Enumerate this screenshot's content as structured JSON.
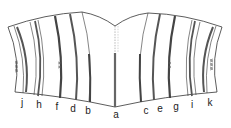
{
  "diagram": {
    "type": "garment-panel-boning-diagram",
    "colors": {
      "outline": "#333333",
      "bone": "#555555",
      "background": "#ffffff"
    },
    "bones": [
      {
        "id": "j",
        "label": "j",
        "x": 37
      },
      {
        "id": "h",
        "label": "h",
        "x": 60
      },
      {
        "id": "f",
        "label": "f",
        "x": 78
      },
      {
        "id": "d",
        "label": "d",
        "x": 96
      },
      {
        "id": "b",
        "label": "b",
        "x": 114
      },
      {
        "id": "a",
        "label": "a",
        "x": 129
      },
      {
        "id": "c",
        "label": "c",
        "x": 146
      },
      {
        "id": "e",
        "label": "e",
        "x": 161
      },
      {
        "id": "g",
        "label": "g",
        "x": 177
      },
      {
        "id": "i",
        "label": "i",
        "x": 191
      },
      {
        "id": "k",
        "label": "k",
        "x": 210
      }
    ]
  },
  "labels": [
    "j",
    "h",
    "f",
    "d",
    "b",
    "a",
    "c",
    "e",
    "g",
    "i",
    "k"
  ]
}
